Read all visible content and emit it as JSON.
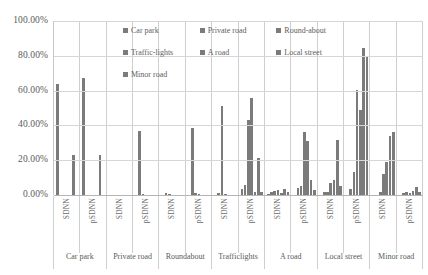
{
  "chart_data": {
    "type": "bar",
    "title": "",
    "subtitle": "",
    "xlabel": "",
    "ylabel": "",
    "ylim": [
      0,
      100
    ],
    "yunit": "%",
    "grid": true,
    "legend_position": "top-center",
    "ytick_labels": [
      "100.00%",
      "80.00%",
      "60.00%",
      "40.00%",
      "20.00%",
      "0.00%"
    ],
    "ytick_values": [
      100,
      80,
      60,
      40,
      20,
      0
    ],
    "categories": [
      "SDNN",
      "pSDNN",
      "SDNN",
      "pSDNN",
      "SDNN",
      "pSDNN",
      "SDNN",
      "pSDNN",
      "SDNN",
      "pSDNN",
      "SDNN",
      "pSDNN",
      "SDNN",
      "pSDNN"
    ],
    "group_labels": [
      "Car park",
      "Private road",
      "Roundabout",
      "Trafficlights",
      "A road",
      "Local street",
      "Minor road"
    ],
    "series": [
      {
        "name": "Car park",
        "values": [
          64.0,
          23.0,
          0.0,
          0.0,
          0.0,
          0.0,
          3.5,
          0.5,
          0.0,
          0.0,
          0.0,
          0.0,
          0.0,
          0.0
        ]
      },
      {
        "name": "Private road",
        "values": [
          0.0,
          0.0,
          37.0,
          1.2,
          38.5,
          1.2,
          5.5,
          1.5,
          4.0,
          1.5,
          3.5,
          0.0,
          1.0,
          0.0
        ]
      },
      {
        "name": "Round-about",
        "values": [
          0.0,
          0.0,
          0.8,
          0.6,
          51.0,
          1.0,
          43.0,
          2.5,
          5.0,
          2.0,
          13.0,
          2.0,
          1.5,
          1.0
        ]
      },
      {
        "name": "Traffic-lights",
        "values": [
          0.0,
          0.0,
          0.0,
          0.0,
          0.8,
          0.5,
          56.0,
          3.0,
          36.0,
          7.0,
          60.5,
          12.0,
          1.0,
          0.5
        ]
      },
      {
        "name": "A road",
        "values": [
          0.0,
          0.0,
          0.0,
          0.0,
          0.0,
          0.0,
          1.5,
          1.0,
          31.0,
          8.5,
          49.0,
          19.0,
          2.5,
          1.5
        ]
      },
      {
        "name": "Local street",
        "values": [
          67.0,
          23.0,
          0.0,
          0.0,
          0.0,
          0.0,
          21.0,
          3.5,
          8.5,
          31.5,
          84.5,
          34.0,
          4.5,
          2.0
        ]
      },
      {
        "name": "Minor road",
        "values": [
          0.0,
          0.0,
          0.0,
          0.0,
          0.0,
          0.0,
          2.0,
          2.0,
          3.0,
          5.0,
          80.0,
          36.5,
          2.0,
          14.0
        ]
      }
    ],
    "bar_matrix": [
      [
        64.0,
        0.0,
        0.0,
        0.0,
        0.0,
        23.0,
        0.0
      ],
      [
        67.0,
        0.0,
        0.0,
        0.0,
        0.0,
        23.0,
        0.0
      ],
      [
        0.0,
        0.0,
        0.0,
        0.0,
        0.0,
        0.0,
        0.0
      ],
      [
        0.0,
        37.0,
        0.8,
        0.0,
        0.0,
        0.0,
        0.0
      ],
      [
        0.0,
        1.2,
        0.6,
        0.0,
        0.0,
        0.0,
        0.0
      ],
      [
        0.0,
        38.5,
        1.0,
        0.8,
        0.0,
        0.0,
        0.0
      ],
      [
        0.0,
        1.2,
        51.0,
        0.5,
        0.0,
        0.0,
        0.0
      ],
      [
        3.5,
        5.5,
        43.0,
        56.0,
        1.5,
        21.0,
        2.0
      ],
      [
        0.5,
        1.5,
        2.5,
        3.0,
        1.0,
        3.5,
        2.0
      ],
      [
        0.0,
        4.0,
        5.0,
        36.0,
        31.0,
        8.5,
        3.0
      ],
      [
        0.0,
        1.5,
        2.0,
        7.0,
        8.5,
        31.5,
        5.0
      ],
      [
        0.0,
        3.5,
        13.0,
        60.5,
        49.0,
        84.5,
        80.0
      ],
      [
        0.0,
        0.0,
        2.0,
        12.0,
        19.0,
        34.0,
        36.5
      ],
      [
        0.0,
        1.0,
        1.5,
        1.0,
        2.5,
        4.5,
        2.0
      ],
      [
        0.0,
        0.0,
        1.0,
        0.5,
        1.5,
        2.0,
        14.0
      ]
    ],
    "series_color": "#7b7b7b"
  },
  "legend": {
    "items": [
      {
        "label": "Car park"
      },
      {
        "label": "Private road"
      },
      {
        "label": "Round-about"
      },
      {
        "label": "Traffic-lights"
      },
      {
        "label": "A road"
      },
      {
        "label": "Local street"
      },
      {
        "label": "Minor road"
      }
    ]
  }
}
